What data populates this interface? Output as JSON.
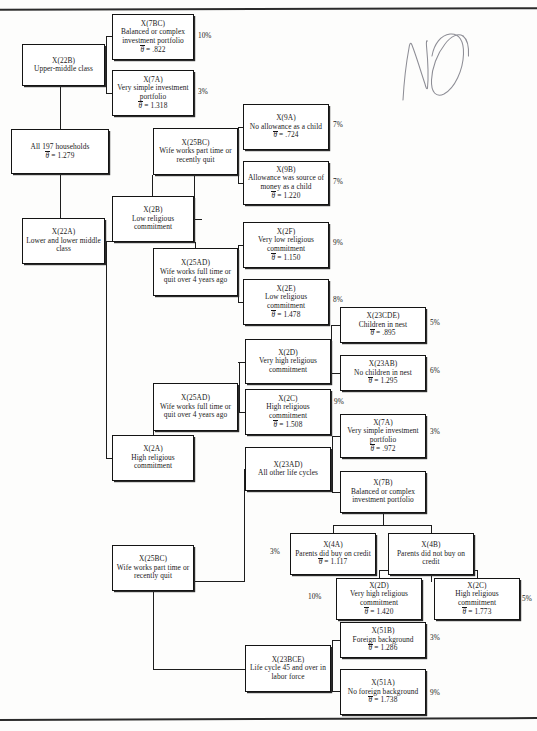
{
  "page": {
    "annotation": "NO",
    "annotation_kind": "handwritten-pencil"
  },
  "symbols": {
    "mean_symbol": "θ",
    "equals": "=",
    "percent_suffix": "%"
  },
  "nodes": [
    {
      "id": "root",
      "code": "",
      "label": "All 197 households",
      "mean": "1.279",
      "pct": null,
      "x": 11,
      "y": 129,
      "w": 98,
      "h": 45
    },
    {
      "id": "n22b",
      "code": "X(22B)",
      "label": "Upper-middle class",
      "mean": null,
      "pct": null,
      "x": 22,
      "y": 44,
      "w": 83,
      "h": 42
    },
    {
      "id": "n7bc",
      "code": "X(7BC)",
      "label": "Balanced or complex investment portfolio",
      "mean": ".822",
      "pct": "10%",
      "x": 112,
      "y": 14,
      "w": 82,
      "h": 46
    },
    {
      "id": "n7a_top",
      "code": "X(7A)",
      "label": "Very simple investment portfolio",
      "mean": "1.318",
      "pct": "3%",
      "x": 112,
      "y": 70,
      "w": 82,
      "h": 46
    },
    {
      "id": "n22a",
      "code": "X(22A)",
      "label": "Lower and lower middle class",
      "mean": null,
      "pct": null,
      "x": 22,
      "y": 218,
      "w": 83,
      "h": 46
    },
    {
      "id": "n2b",
      "code": "X(2B)",
      "label": "Low religious commitment",
      "mean": null,
      "pct": null,
      "x": 112,
      "y": 196,
      "w": 82,
      "h": 46
    },
    {
      "id": "n25bc_1",
      "code": "X(25BC)",
      "label": "Wife works part time or recently quit",
      "mean": null,
      "pct": null,
      "x": 153,
      "y": 128,
      "w": 85,
      "h": 47
    },
    {
      "id": "n9a",
      "code": "X(9A)",
      "label": "No allowance as a child",
      "mean": ".724",
      "pct": "7%",
      "x": 243,
      "y": 104,
      "w": 86,
      "h": 46
    },
    {
      "id": "n9b",
      "code": "X(9B)",
      "label": "Allowance was source of money as a child",
      "mean": "1.220",
      "pct": "7%",
      "x": 243,
      "y": 161,
      "w": 86,
      "h": 44
    },
    {
      "id": "n25ad_1",
      "code": "X(25AD)",
      "label": "Wife works full time or quit over 4 years ago",
      "mean": null,
      "pct": null,
      "x": 153,
      "y": 248,
      "w": 85,
      "h": 48
    },
    {
      "id": "n2f",
      "code": "X(2F)",
      "label": "Very low religious commitment",
      "mean": "1.150",
      "pct": "9%",
      "x": 243,
      "y": 222,
      "w": 86,
      "h": 46
    },
    {
      "id": "n2e",
      "code": "X(2E)",
      "label": "Low religious commitment",
      "mean": "1.478",
      "pct": "8%",
      "x": 243,
      "y": 279,
      "w": 86,
      "h": 46
    },
    {
      "id": "n2a",
      "code": "X(2A)",
      "label": "High religious commitment",
      "mean": null,
      "pct": null,
      "x": 112,
      "y": 435,
      "w": 82,
      "h": 46
    },
    {
      "id": "n25ad_2",
      "code": "X(25AD)",
      "label": "Wife works full time or quit over 4 years ago",
      "mean": null,
      "pct": null,
      "x": 153,
      "y": 383,
      "w": 85,
      "h": 48
    },
    {
      "id": "n2d_1",
      "code": "X(2D)",
      "label": "Very high religious commitment",
      "mean": null,
      "pct": null,
      "x": 245,
      "y": 339,
      "w": 86,
      "h": 45
    },
    {
      "id": "n2c_1",
      "code": "X(2C)",
      "label": "High religious commitment",
      "mean": "1.508",
      "pct": "9%",
      "x": 245,
      "y": 389,
      "w": 86,
      "h": 46
    },
    {
      "id": "n23cde",
      "code": "X(23CDE)",
      "label": "Children in nest",
      "mean": ".895",
      "pct": "5%",
      "x": 340,
      "y": 307,
      "w": 86,
      "h": 36
    },
    {
      "id": "n23ab",
      "code": "X(23AB)",
      "label": "No children in nest",
      "mean": "1.295",
      "pct": "6%",
      "x": 340,
      "y": 355,
      "w": 86,
      "h": 36
    },
    {
      "id": "n23ad",
      "code": "X(23AD)",
      "label": "All other life cycles",
      "mean": null,
      "pct": null,
      "x": 245,
      "y": 447,
      "w": 86,
      "h": 44
    },
    {
      "id": "n7a_mid",
      "code": "X(7A)",
      "label": "Very simple investment portfolio",
      "mean": ".972",
      "pct": "3%",
      "x": 340,
      "y": 414,
      "w": 86,
      "h": 44
    },
    {
      "id": "n7b",
      "code": "X(7B)",
      "label": "Balanced or complex investment portfolio",
      "mean": null,
      "pct": null,
      "x": 340,
      "y": 471,
      "w": 86,
      "h": 42
    },
    {
      "id": "n4a",
      "code": "X(4A)",
      "label": "Parents did buy on credit",
      "mean": "1.117",
      "pct": "3%",
      "x": 290,
      "y": 533,
      "w": 86,
      "h": 42
    },
    {
      "id": "n4b",
      "code": "X(4B)",
      "label": "Parents did not buy on credit",
      "mean": null,
      "pct": null,
      "x": 388,
      "y": 533,
      "w": 86,
      "h": 42
    },
    {
      "id": "n2d_2",
      "code": "X(2D)",
      "label": "Very high religious commitment",
      "mean": "1.420",
      "pct": "10%",
      "x": 336,
      "y": 578,
      "w": 86,
      "h": 42
    },
    {
      "id": "n2c_2",
      "code": "X(2C)",
      "label": "High religious commitment",
      "mean": "1.773",
      "pct": "5%",
      "x": 434,
      "y": 578,
      "w": 86,
      "h": 42
    },
    {
      "id": "n25bc_2",
      "code": "X(25BC)",
      "label": "Wife works part time or recently quit",
      "mean": null,
      "pct": null,
      "x": 112,
      "y": 545,
      "w": 82,
      "h": 46
    },
    {
      "id": "n23bce",
      "code": "X(23BCE)",
      "label": "Life cycle 45 and over in labor force",
      "mean": null,
      "pct": null,
      "x": 245,
      "y": 645,
      "w": 86,
      "h": 47
    },
    {
      "id": "n51b",
      "code": "X(51B)",
      "label": "Foreign background",
      "mean": "1.286",
      "pct": "3%",
      "x": 340,
      "y": 622,
      "w": 86,
      "h": 36
    },
    {
      "id": "n51a",
      "code": "X(51A)",
      "label": "No foreign background",
      "mean": "1.738",
      "pct": "9%",
      "x": 340,
      "y": 669,
      "w": 86,
      "h": 46
    }
  ],
  "percent_labels": [
    {
      "for": "n7bc",
      "value": "10%",
      "x": 198,
      "y": 31
    },
    {
      "for": "n7a_top",
      "value": "3%",
      "x": 198,
      "y": 87
    },
    {
      "for": "n9a",
      "value": "7%",
      "x": 333,
      "y": 120
    },
    {
      "for": "n9b",
      "value": "7%",
      "x": 333,
      "y": 177
    },
    {
      "for": "n2f",
      "value": "9%",
      "x": 333,
      "y": 238
    },
    {
      "for": "n2e",
      "value": "8%",
      "x": 333,
      "y": 295
    },
    {
      "for": "n23cde",
      "value": "5%",
      "x": 430,
      "y": 318
    },
    {
      "for": "n23ab",
      "value": "6%",
      "x": 430,
      "y": 366
    },
    {
      "for": "n2c_1",
      "value": "9%",
      "x": 334,
      "y": 397
    },
    {
      "for": "n7a_mid",
      "value": "3%",
      "x": 430,
      "y": 427
    },
    {
      "for": "n4a",
      "value": "3%",
      "x": 270,
      "y": 547
    },
    {
      "for": "n2d_2",
      "value": "10%",
      "x": 308,
      "y": 592
    },
    {
      "for": "n2c_2",
      "value": "5%",
      "x": 522,
      "y": 594
    },
    {
      "for": "n51b",
      "value": "3%",
      "x": 430,
      "y": 633
    },
    {
      "for": "n51a",
      "value": "9%",
      "x": 430,
      "y": 688
    }
  ],
  "connectors": [
    {
      "kind": "v",
      "x": 60,
      "y": 86,
      "len": 43
    },
    {
      "kind": "v",
      "x": 106,
      "y": 36,
      "len": 58
    },
    {
      "kind": "h",
      "x": 106,
      "y": 36,
      "len": 7
    },
    {
      "kind": "h",
      "x": 106,
      "y": 93,
      "len": 7
    },
    {
      "kind": "h",
      "x": 101,
      "y": 65,
      "len": 6
    },
    {
      "kind": "v",
      "x": 60,
      "y": 174,
      "len": 67
    },
    {
      "kind": "h",
      "x": 105,
      "y": 241,
      "len": 8
    },
    {
      "kind": "v",
      "x": 194,
      "y": 151,
      "len": 68
    },
    {
      "kind": "h",
      "x": 194,
      "y": 151,
      "len": 8
    },
    {
      "kind": "h",
      "x": 194,
      "y": 219,
      "len": 8
    },
    {
      "kind": "v",
      "x": 152,
      "y": 175,
      "len": 21
    },
    {
      "kind": "v",
      "x": 238,
      "y": 127,
      "len": 57
    },
    {
      "kind": "h",
      "x": 238,
      "y": 127,
      "len": 6
    },
    {
      "kind": "h",
      "x": 238,
      "y": 183,
      "len": 6
    },
    {
      "kind": "h",
      "x": 232,
      "y": 151,
      "len": 7
    },
    {
      "kind": "v",
      "x": 238,
      "y": 245,
      "len": 57
    },
    {
      "kind": "h",
      "x": 238,
      "y": 245,
      "len": 6
    },
    {
      "kind": "h",
      "x": 238,
      "y": 302,
      "len": 6
    },
    {
      "kind": "h",
      "x": 232,
      "y": 272,
      "len": 7
    },
    {
      "kind": "v",
      "x": 195,
      "y": 242,
      "len": 31
    },
    {
      "kind": "v",
      "x": 106,
      "y": 241,
      "len": 218
    },
    {
      "kind": "h",
      "x": 106,
      "y": 458,
      "len": 7
    },
    {
      "kind": "v",
      "x": 153,
      "y": 431,
      "len": 27
    },
    {
      "kind": "h",
      "x": 238,
      "y": 362,
      "len": 8
    },
    {
      "kind": "h",
      "x": 238,
      "y": 412,
      "len": 8
    },
    {
      "kind": "v",
      "x": 239,
      "y": 362,
      "len": 50
    },
    {
      "kind": "h",
      "x": 232,
      "y": 406,
      "len": 7
    },
    {
      "kind": "v",
      "x": 331,
      "y": 325,
      "len": 48
    },
    {
      "kind": "h",
      "x": 331,
      "y": 325,
      "len": 10
    },
    {
      "kind": "h",
      "x": 331,
      "y": 373,
      "len": 10
    },
    {
      "kind": "h",
      "x": 327,
      "y": 361,
      "len": 5
    },
    {
      "kind": "v",
      "x": 332,
      "y": 436,
      "len": 56
    },
    {
      "kind": "h",
      "x": 332,
      "y": 436,
      "len": 9
    },
    {
      "kind": "h",
      "x": 332,
      "y": 492,
      "len": 9
    },
    {
      "kind": "h",
      "x": 327,
      "y": 469,
      "len": 6
    },
    {
      "kind": "v",
      "x": 244,
      "y": 469,
      "len": 112
    },
    {
      "kind": "h",
      "x": 194,
      "y": 581,
      "len": 51
    },
    {
      "kind": "v",
      "x": 383,
      "y": 513,
      "len": 12
    },
    {
      "kind": "h",
      "x": 333,
      "y": 525,
      "len": 98
    },
    {
      "kind": "v",
      "x": 333,
      "y": 525,
      "len": 9
    },
    {
      "kind": "v",
      "x": 431,
      "y": 525,
      "len": 9
    },
    {
      "kind": "v",
      "x": 431,
      "y": 575,
      "len": 7
    },
    {
      "kind": "h",
      "x": 379,
      "y": 570,
      "len": 98
    },
    {
      "kind": "v",
      "x": 379,
      "y": 570,
      "len": 9
    },
    {
      "kind": "v",
      "x": 477,
      "y": 570,
      "len": 9
    },
    {
      "kind": "v",
      "x": 153,
      "y": 591,
      "len": 78
    },
    {
      "kind": "h",
      "x": 153,
      "y": 669,
      "len": 92
    },
    {
      "kind": "v",
      "x": 332,
      "y": 640,
      "len": 52
    },
    {
      "kind": "h",
      "x": 332,
      "y": 640,
      "len": 9
    },
    {
      "kind": "h",
      "x": 332,
      "y": 691,
      "len": 9
    },
    {
      "kind": "h",
      "x": 327,
      "y": 668,
      "len": 6
    }
  ]
}
